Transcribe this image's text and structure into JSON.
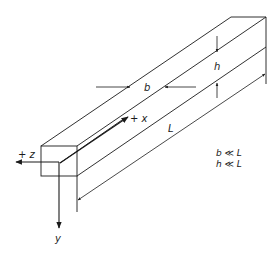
{
  "diagram": {
    "labels": {
      "x_axis": "+ x",
      "y_axis": "y",
      "z_axis": "+ z",
      "width": "b",
      "height": "h",
      "length": "L",
      "condition_1": "b ≪ L",
      "condition_2": "h ≪ L"
    },
    "colors": {
      "line": "#1a1a1a",
      "background": "#ffffff"
    }
  }
}
